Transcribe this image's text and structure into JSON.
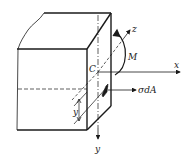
{
  "diagram": {
    "type": "beam-pure-bending-cross-section",
    "labels": {
      "centroid": "C",
      "x_axis": "x",
      "y_axis": "y",
      "z_axis": "z",
      "moment": "M",
      "force_element": "σdA",
      "distance": "y"
    },
    "colors": {
      "stroke": "#1a1a1a",
      "background": "#ffffff"
    }
  }
}
